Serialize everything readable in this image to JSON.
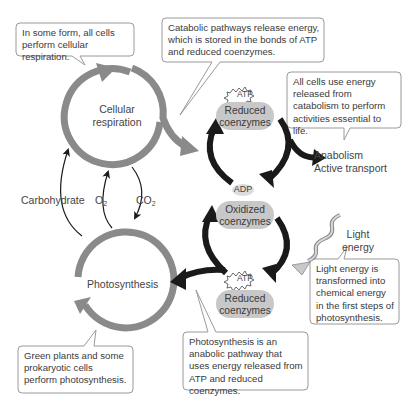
{
  "callouts": {
    "cellular_respiration_note": "In some form, all cells perform cellular respiration.",
    "catabolic_note": "Catabolic pathways release energy, which is stored in the bonds of ATP and reduced coenzymes.",
    "all_cells_note": "All cells use energy released from catabolism to perform activities essential to life.",
    "light_energy_note": "Light energy is transformed into chemical energy in the first steps of photosynthesis.",
    "photosynthesis_anabolic_note": "Photosynthesis is an anabolic pathway that uses energy released from ATP and reduced coenzymes.",
    "green_plants_note": "Green plants and some prokaryotic cells perform photosynthesis."
  },
  "cycles": {
    "cellular_respiration": {
      "line1": "Cellular",
      "line2": "respiration"
    },
    "photosynthesis": "Photosynthesis"
  },
  "exchange": {
    "carbohydrate": "Carbohydrate",
    "o2": "O",
    "o2_sub": "2",
    "co2": "CO",
    "co2_sub": "2"
  },
  "energy_cycle": {
    "atp_top": "ATP",
    "reduced_top": {
      "line1": "Reduced",
      "line2": "coenzymes"
    },
    "adp": "ADP",
    "oxidized": {
      "line1": "Oxidized",
      "line2": "coenzymes"
    },
    "atp_bottom": "ATP",
    "reduced_bottom": {
      "line1": "Reduced",
      "line2": "coenzymes"
    }
  },
  "outputs": {
    "anabolism": "Anabolism",
    "active_transport": "Active transport"
  },
  "light": {
    "line1": "Light",
    "line2": "energy"
  },
  "colors": {
    "gray_cycle": "#8a8a8a",
    "black_arrows": "#1a1a1a",
    "pill_fill": "#c8c8c8",
    "callout_border": "#9a9a9a"
  }
}
